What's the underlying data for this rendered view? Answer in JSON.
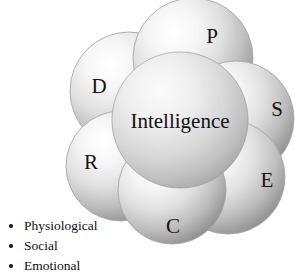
{
  "figure": {
    "name": "intelligence-petal-diagram",
    "background_color": "#ffffff",
    "core": {
      "label": "Intelligence",
      "cx": 180,
      "cy": 120,
      "r": 68
    },
    "petals": [
      {
        "key": "p",
        "label": "P",
        "cx": 193,
        "cy": 58,
        "r": 60,
        "label_x": 212,
        "label_y": 38
      },
      {
        "key": "s",
        "label": "S",
        "cx": 236,
        "cy": 119,
        "r": 58,
        "label_x": 277,
        "label_y": 111
      },
      {
        "key": "e",
        "label": "E",
        "cx": 228,
        "cy": 177,
        "r": 57,
        "label_x": 267,
        "label_y": 182
      },
      {
        "key": "c",
        "label": "C",
        "cx": 172,
        "cy": 190,
        "r": 54,
        "label_x": 173,
        "label_y": 228
      },
      {
        "key": "r",
        "label": "R",
        "cx": 121,
        "cy": 166,
        "r": 55,
        "label_x": 91,
        "label_y": 164
      },
      {
        "key": "d",
        "label": "D",
        "cx": 129,
        "cy": 91,
        "r": 59,
        "label_x": 99,
        "label_y": 88
      }
    ],
    "colors": {
      "sphere_highlight": "#ffffff",
      "sphere_mid": "#d5d5d5",
      "sphere_shadow": "#8c8c8c",
      "sphere_outline": "#a8a8a8",
      "core_highlight": "#f2f2f2",
      "core_mid": "#cfcfcf",
      "core_shadow": "#9a9a9a",
      "text": "#121212"
    }
  },
  "legend": {
    "items": [
      {
        "label": "Physiological"
      },
      {
        "label": "Social"
      },
      {
        "label": "Emotional"
      }
    ]
  }
}
